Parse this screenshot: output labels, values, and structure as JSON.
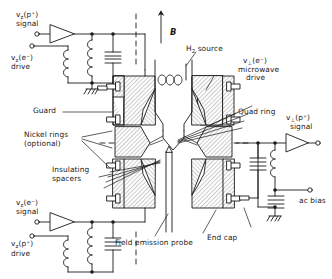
{
  "figure": {
    "background_color": "#ffffff",
    "line_color": "#1a1a1a",
    "hatch_color": "#9a9a9a",
    "width": 332,
    "height": 279
  },
  "field": {
    "symbol": "B",
    "arrow_name": "magnetic-field-arrow"
  },
  "labels": {
    "h2_source": "H<sub>2</sub> source",
    "microwave_drive_line1": "v<sub>&#8869;</sub>(e&#8315;)",
    "microwave_drive_line2": "microwave",
    "microwave_drive_line3": "drive",
    "quad_ring": "Quad ring",
    "guard": "Guard",
    "nickel_rings_line1": "Nickel rings",
    "nickel_rings_line2": "(optional)",
    "insulating_line1": "Insulating",
    "insulating_line2": "spacers",
    "field_emission_probe": "Field emission probe",
    "end_cap": "End cap",
    "ac_bias": "ac bias"
  },
  "ports": {
    "top_left_signal_line1": "v<sub>z</sub>(p&#8314;)",
    "top_left_signal_line2": "signal",
    "top_left_drive_line1": "v<sub>z</sub>(e&#8315;)",
    "top_left_drive_line2": "drive",
    "bottom_left_signal_line1": "v<sub>z</sub>(e&#8315;)",
    "bottom_left_signal_line2": "signal",
    "bottom_left_drive_line1": "v<sub>z</sub>(p&#8314;)",
    "bottom_left_drive_line2": "drive",
    "right_signal_line1": "v<sub>&#8869;</sub>(p&#8314;)",
    "right_signal_line2": "signal"
  },
  "components": {
    "amplifier_top_left": "triangle-amplifier",
    "amplifier_bottom_left": "triangle-amplifier",
    "amplifier_right": "triangle-amplifier",
    "inductor_count": 5,
    "capacitor_count": 4,
    "ground_count": 3
  }
}
